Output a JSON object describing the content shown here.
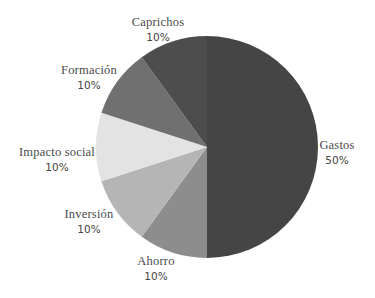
{
  "chart_data": {
    "type": "pie",
    "title": "",
    "start_angle_deg": 0,
    "direction": "clockwise",
    "center": [
      207,
      147
    ],
    "radius": 111,
    "slices": [
      {
        "label": "Gastos",
        "value": 50,
        "pct_label": "50%",
        "color": "#454545"
      },
      {
        "label": "Ahorro",
        "value": 10,
        "pct_label": "10%",
        "color": "#8d8d8d"
      },
      {
        "label": "Inversión",
        "value": 10,
        "pct_label": "10%",
        "color": "#b5b5b5"
      },
      {
        "label": "Impacto social",
        "value": 10,
        "pct_label": "10%",
        "color": "#e3e3e3"
      },
      {
        "label": "Formación",
        "value": 10,
        "pct_label": "10%",
        "color": "#707070"
      },
      {
        "label": "Caprichos",
        "value": 10,
        "pct_label": "10%",
        "color": "#4d4d4d"
      }
    ],
    "legend": "none"
  },
  "labels": [
    {
      "name": "Gastos",
      "pct": "50%",
      "x": 337,
      "y": 138
    },
    {
      "name": "Ahorro",
      "pct": "10%",
      "x": 156,
      "y": 254
    },
    {
      "name": "Inversión",
      "pct": "10%",
      "x": 89,
      "y": 207
    },
    {
      "name": "Impacto social",
      "pct": "10%",
      "x": 57,
      "y": 145
    },
    {
      "name": "Formación",
      "pct": "10%",
      "x": 89,
      "y": 63
    },
    {
      "name": "Caprichos",
      "pct": "10%",
      "x": 158,
      "y": 15
    }
  ]
}
